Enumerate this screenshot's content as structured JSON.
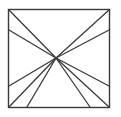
{
  "figure": {
    "type": "line-diagram",
    "canvas": {
      "width": 121,
      "height": 117,
      "background": "#ffffff"
    },
    "frame": {
      "name": "outer-square",
      "x": 8.5,
      "y": 9.5,
      "width": 101,
      "height": 98,
      "stroke": "#3a3a3a",
      "stroke_width": 1.4,
      "fill": "#ffffff"
    },
    "hub": {
      "name": "convergence-point",
      "x": 56,
      "y": 58,
      "label": ""
    },
    "stroke": {
      "color": "#3a3a3a",
      "width": 1.3
    },
    "rays": [
      {
        "name": "ray-to-top-left-corner",
        "x1": 56,
        "y1": 58,
        "x2": 9,
        "y2": 10,
        "endpoint_edge": "corner-top-left"
      },
      {
        "name": "ray-to-top-right-corner",
        "x1": 56,
        "y1": 58,
        "x2": 109,
        "y2": 10,
        "endpoint_edge": "corner-top-right"
      },
      {
        "name": "ray-to-bottom-left-corner",
        "x1": 56,
        "y1": 58,
        "x2": 9,
        "y2": 107,
        "endpoint_edge": "corner-bottom-left"
      },
      {
        "name": "ray-to-bottom-right-corner",
        "x1": 56,
        "y1": 58,
        "x2": 109,
        "y2": 107,
        "endpoint_edge": "corner-bottom-right"
      },
      {
        "name": "ray-to-left-edge-upper",
        "x1": 56,
        "y1": 58,
        "x2": 9,
        "y2": 30,
        "endpoint_edge": "left"
      },
      {
        "name": "ray-to-right-edge-upper",
        "x1": 56,
        "y1": 58,
        "x2": 109,
        "y2": 30,
        "endpoint_edge": "right"
      },
      {
        "name": "ray-to-left-edge-lower",
        "x1": 56,
        "y1": 58,
        "x2": 9,
        "y2": 86,
        "endpoint_edge": "left"
      },
      {
        "name": "ray-to-right-edge-lower",
        "x1": 56,
        "y1": 58,
        "x2": 109,
        "y2": 86,
        "endpoint_edge": "right"
      },
      {
        "name": "ray-to-bottom-edge-left",
        "x1": 56,
        "y1": 58,
        "x2": 27,
        "y2": 107,
        "endpoint_edge": "bottom"
      },
      {
        "name": "ray-to-bottom-edge-right",
        "x1": 56,
        "y1": 58,
        "x2": 90,
        "y2": 107,
        "endpoint_edge": "bottom"
      }
    ]
  }
}
